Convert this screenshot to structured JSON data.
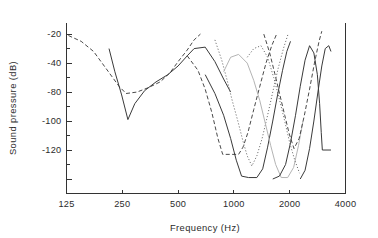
{
  "figure": {
    "background_color": "#ffffff",
    "axis_color": "#333333",
    "text_color": "#2b2b2b"
  },
  "chart_data": {
    "type": "line",
    "title": "",
    "xlabel": "Frequency (Hz)",
    "ylabel": "Sound pressure (dB)",
    "xscale": "log",
    "xlim": [
      125,
      4000
    ],
    "ylim": [
      -130,
      -12
    ],
    "grid": false,
    "legend": "none",
    "xticks": [
      125,
      250,
      500,
      1000,
      2000,
      4000
    ],
    "xtick_labels": [
      "125",
      "250",
      "500",
      "1000",
      "2000",
      "4000"
    ],
    "yticks": [
      -20,
      -30,
      -40,
      -50,
      -60,
      -70,
      -80,
      -90,
      -100,
      -110,
      -120
    ],
    "ytick_labels": [
      "-20",
      "",
      "-40",
      "",
      "-80",
      "",
      "-100",
      "",
      "-120"
    ],
    "ytick_labeled_values": [
      -20,
      -40,
      -60,
      -80,
      -100,
      -120
    ],
    "ytick_labeled_text": [
      "-20",
      "-40",
      "-80",
      "-100",
      "-120"
    ],
    "series": [
      {
        "name": "curve-1-dashed-low",
        "style": "dashed",
        "color": "#4a4a4a",
        "width": 1.0,
        "points": [
          [
            128,
            -21
          ],
          [
            150,
            -25
          ],
          [
            175,
            -32
          ],
          [
            205,
            -44
          ],
          [
            240,
            -56
          ],
          [
            262,
            -61
          ],
          [
            300,
            -60
          ],
          [
            345,
            -57
          ],
          [
            400,
            -53
          ],
          [
            450,
            -47
          ],
          [
            500,
            -39
          ],
          [
            560,
            -31
          ],
          [
            610,
            -24
          ],
          [
            660,
            -20
          ]
        ]
      },
      {
        "name": "curve-2-solid-low",
        "style": "solid",
        "color": "#3a3a3a",
        "width": 1.0,
        "points": [
          [
            212,
            -30
          ],
          [
            228,
            -46
          ],
          [
            248,
            -62
          ],
          [
            268,
            -79
          ],
          [
            292,
            -68
          ],
          [
            330,
            -59
          ],
          [
            380,
            -53
          ],
          [
            440,
            -48
          ],
          [
            500,
            -42
          ],
          [
            560,
            -35
          ],
          [
            610,
            -30
          ],
          [
            700,
            -29
          ],
          [
            790,
            -39
          ],
          [
            880,
            -51
          ],
          [
            960,
            -60
          ]
        ]
      },
      {
        "name": "curve-3-dashed-mid",
        "style": "dashed",
        "color": "#4a4a4a",
        "width": 1.0,
        "points": [
          [
            560,
            -35
          ],
          [
            640,
            -45
          ],
          [
            700,
            -58
          ],
          [
            760,
            -74
          ],
          [
            820,
            -92
          ],
          [
            870,
            -103
          ],
          [
            960,
            -103
          ],
          [
            1060,
            -103
          ],
          [
            1120,
            -98
          ],
          [
            1190,
            -88
          ],
          [
            1280,
            -72
          ],
          [
            1380,
            -56
          ],
          [
            1490,
            -40
          ],
          [
            1600,
            -28
          ],
          [
            1700,
            -20
          ]
        ]
      },
      {
        "name": "curve-4-dotted-mid",
        "style": "dotted",
        "color": "#6b6b6b",
        "width": 1.0,
        "points": [
          [
            790,
            -24
          ],
          [
            860,
            -38
          ],
          [
            920,
            -52
          ],
          [
            980,
            -66
          ],
          [
            1050,
            -80
          ],
          [
            1120,
            -94
          ],
          [
            1180,
            -104
          ],
          [
            1250,
            -111
          ],
          [
            1330,
            -104
          ],
          [
            1420,
            -92
          ],
          [
            1520,
            -76
          ],
          [
            1620,
            -60
          ],
          [
            1730,
            -44
          ],
          [
            1850,
            -30
          ],
          [
            1960,
            -20
          ]
        ]
      },
      {
        "name": "curve-5-solid-mid",
        "style": "solid",
        "color": "#3a3a3a",
        "width": 1.0,
        "points": [
          [
            700,
            -48
          ],
          [
            790,
            -61
          ],
          [
            880,
            -76
          ],
          [
            960,
            -92
          ],
          [
            1030,
            -107
          ],
          [
            1100,
            -118
          ],
          [
            1200,
            -119
          ],
          [
            1330,
            -119
          ],
          [
            1430,
            -113
          ],
          [
            1520,
            -98
          ],
          [
            1620,
            -80
          ],
          [
            1720,
            -62
          ],
          [
            1830,
            -45
          ],
          [
            1930,
            -32
          ],
          [
            2020,
            -25
          ]
        ]
      },
      {
        "name": "curve-6-gray-mid",
        "style": "solid",
        "color": "#b4b4b4",
        "width": 1.0,
        "points": [
          [
            880,
            -46
          ],
          [
            960,
            -36
          ],
          [
            1060,
            -34
          ],
          [
            1180,
            -40
          ],
          [
            1280,
            -52
          ],
          [
            1380,
            -66
          ],
          [
            1480,
            -82
          ],
          [
            1580,
            -97
          ],
          [
            1680,
            -110
          ],
          [
            1800,
            -119
          ],
          [
            1950,
            -119
          ],
          [
            2100,
            -112
          ],
          [
            2230,
            -97
          ],
          [
            2360,
            -80
          ]
        ]
      },
      {
        "name": "curve-7-dashed-right",
        "style": "dashed",
        "color": "#4a4a4a",
        "width": 1.0,
        "points": [
          [
            1450,
            -20
          ],
          [
            1560,
            -33
          ],
          [
            1660,
            -47
          ],
          [
            1770,
            -62
          ],
          [
            1880,
            -76
          ],
          [
            1990,
            -89
          ],
          [
            2110,
            -99
          ],
          [
            2250,
            -92
          ],
          [
            2400,
            -76
          ],
          [
            2560,
            -58
          ],
          [
            2720,
            -40
          ],
          [
            2880,
            -25
          ],
          [
            2980,
            -18
          ]
        ]
      },
      {
        "name": "curve-8-solid-right",
        "style": "solid",
        "color": "#3a3a3a",
        "width": 1.0,
        "points": [
          [
            1620,
            -120
          ],
          [
            1760,
            -118
          ],
          [
            1900,
            -110
          ],
          [
            2020,
            -95
          ],
          [
            2150,
            -76
          ],
          [
            2280,
            -56
          ],
          [
            2420,
            -38
          ],
          [
            2560,
            -28
          ],
          [
            2700,
            -33
          ],
          [
            2820,
            -48
          ],
          [
            2900,
            -68
          ],
          [
            2960,
            -88
          ],
          [
            3000,
            -100
          ],
          [
            3180,
            -100
          ],
          [
            3340,
            -100
          ]
        ]
      },
      {
        "name": "curve-9-solid-far-right",
        "style": "solid",
        "color": "#3a3a3a",
        "width": 1.0,
        "points": [
          [
            2280,
            -120
          ],
          [
            2420,
            -114
          ],
          [
            2560,
            -99
          ],
          [
            2700,
            -80
          ],
          [
            2840,
            -60
          ],
          [
            2980,
            -42
          ],
          [
            3110,
            -30
          ],
          [
            3250,
            -28
          ],
          [
            3340,
            -32
          ]
        ]
      },
      {
        "name": "curve-10-dotted-right",
        "style": "dotted",
        "color": "#6b6b6b",
        "width": 1.0,
        "points": [
          [
            1180,
            -36
          ],
          [
            1280,
            -30
          ],
          [
            1400,
            -28
          ],
          [
            1520,
            -36
          ],
          [
            1640,
            -50
          ],
          [
            1760,
            -65
          ],
          [
            1880,
            -80
          ],
          [
            2000,
            -95
          ],
          [
            2130,
            -107
          ],
          [
            2260,
            -116
          ]
        ]
      }
    ]
  }
}
